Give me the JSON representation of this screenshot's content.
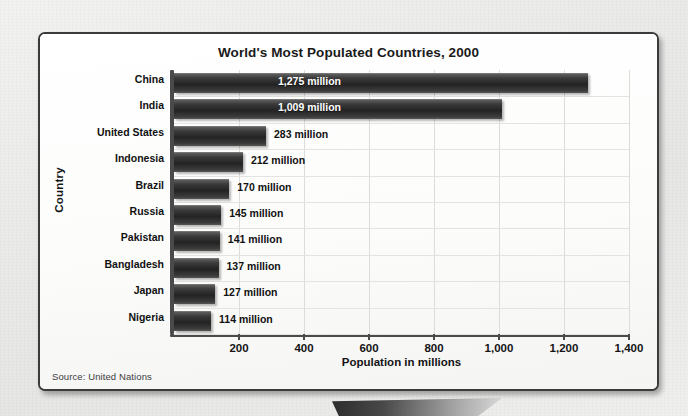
{
  "chart_data": {
    "type": "bar",
    "orientation": "horizontal",
    "title": "World's Most Populated Countries, 2000",
    "xlabel": "Population in millions",
    "ylabel": "Country",
    "xlim": [
      0,
      1400
    ],
    "grid": true,
    "legend": null,
    "source": "Source: United Nations",
    "xticks": [
      "200",
      "400",
      "600",
      "800",
      "1,000",
      "1,200",
      "1,400"
    ],
    "xtick_values": [
      200,
      400,
      600,
      800,
      1000,
      1200,
      1400
    ],
    "categories": [
      "China",
      "India",
      "United States",
      "Indonesia",
      "Brazil",
      "Russia",
      "Pakistan",
      "Bangladesh",
      "Japan",
      "Nigeria"
    ],
    "values": [
      1275,
      1009,
      283,
      212,
      170,
      145,
      141,
      137,
      127,
      114
    ],
    "data_labels": [
      "1,275 million",
      "1,009 million",
      "283 million",
      "212 million",
      "170 million",
      "145 million",
      "141 million",
      "137 million",
      "127 million",
      "114 million"
    ],
    "bars": [
      {
        "category": "China",
        "value": 1275,
        "label": "1,275 million",
        "label_position": "inside"
      },
      {
        "category": "India",
        "value": 1009,
        "label": "1,009 million",
        "label_position": "inside"
      },
      {
        "category": "United States",
        "value": 283,
        "label": "283 million",
        "label_position": "outside"
      },
      {
        "category": "Indonesia",
        "value": 212,
        "label": "212 million",
        "label_position": "outside"
      },
      {
        "category": "Brazil",
        "value": 170,
        "label": "170 million",
        "label_position": "outside"
      },
      {
        "category": "Russia",
        "value": 145,
        "label": "145 million",
        "label_position": "outside"
      },
      {
        "category": "Pakistan",
        "value": 141,
        "label": "141 million",
        "label_position": "outside"
      },
      {
        "category": "Bangladesh",
        "value": 137,
        "label": "137 million",
        "label_position": "outside"
      },
      {
        "category": "Japan",
        "value": 127,
        "label": "127 million",
        "label_position": "outside"
      },
      {
        "category": "Nigeria",
        "value": 114,
        "label": "114 million",
        "label_position": "outside"
      }
    ],
    "colors": {
      "bar": "#232323",
      "panel_background": "#fdfdfc",
      "panel_border": "#3b3b3b",
      "axis": "#4a4a4a",
      "gridline": "#dcdcda",
      "text": "#111111",
      "page_background": "#ececeb"
    }
  }
}
